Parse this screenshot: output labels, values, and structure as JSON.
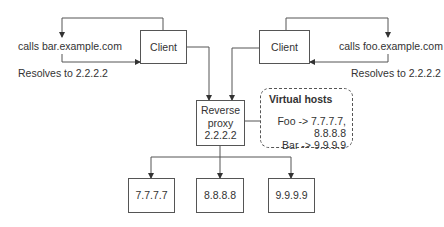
{
  "diagram": {
    "left_client": {
      "label": "Client",
      "call_label": "calls bar.example.com",
      "resolve_label": "Resolves to 2.2.2.2"
    },
    "right_client": {
      "label": "Client",
      "call_label": "calls foo.example.com",
      "resolve_label": "Resolves to 2.2.2.2"
    },
    "proxy": {
      "line1": "Reverse",
      "line2": "proxy",
      "line3": "2.2.2.2"
    },
    "virtual_hosts": {
      "title": "Virtual hosts",
      "entries": [
        "Foo -> 7.7.7.7,",
        "8.8.8.8",
        "Bar -> 9.9.9.9"
      ]
    },
    "backends": [
      {
        "label": "7.7.7.7"
      },
      {
        "label": "8.8.8.8"
      },
      {
        "label": "9.9.9.9"
      }
    ],
    "colors": {
      "line": "#555555",
      "text": "#333333",
      "background": "#ffffff"
    }
  }
}
